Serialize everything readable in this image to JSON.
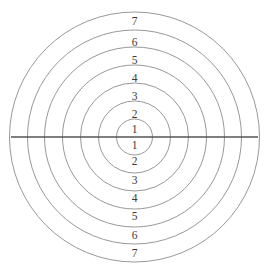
{
  "figure": {
    "name": "concentric-ring-target",
    "background_color": "#ffffff",
    "ring_stroke_color": "#8c8c8c",
    "axis_stroke_color": "#555555",
    "label_color": "#3a3a3a"
  },
  "chart_data": {
    "type": "scatter",
    "title": "",
    "subtitle": "",
    "xlabel": "",
    "ylabel": "",
    "grid": false,
    "legend": "none",
    "center": {
      "x": 134.5,
      "y": 137
    },
    "axis_ranges": {
      "x": [
        11,
        258
      ],
      "y": [
        12,
        262
      ]
    },
    "horizontal_line": {
      "x1": 11,
      "x2": 258,
      "y": 137
    },
    "ring_count": 7,
    "rings": [
      {
        "index": 1,
        "radius": 18,
        "label": "1"
      },
      {
        "index": 2,
        "radius": 36,
        "label": "2"
      },
      {
        "index": 3,
        "radius": 54,
        "label": "3"
      },
      {
        "index": 4,
        "radius": 72,
        "label": "4"
      },
      {
        "index": 5,
        "radius": 90,
        "label": "5"
      },
      {
        "index": 6,
        "radius": 107,
        "label": "6"
      },
      {
        "index": 7,
        "radius": 125,
        "label": "7"
      }
    ],
    "labels_above": [
      {
        "text": "7",
        "x": 134.5,
        "y": 22
      },
      {
        "text": "6",
        "x": 134.5,
        "y": 43
      },
      {
        "text": "5",
        "x": 134.5,
        "y": 61
      },
      {
        "text": "4",
        "x": 134.5,
        "y": 79
      },
      {
        "text": "3",
        "x": 134.5,
        "y": 97
      },
      {
        "text": "2",
        "x": 134.5,
        "y": 115
      },
      {
        "text": "1",
        "x": 134.5,
        "y": 130
      }
    ],
    "labels_below": [
      {
        "text": "1",
        "x": 134.5,
        "y": 146
      },
      {
        "text": "2",
        "x": 134.5,
        "y": 162
      },
      {
        "text": "3",
        "x": 134.5,
        "y": 181
      },
      {
        "text": "4",
        "x": 134.5,
        "y": 199
      },
      {
        "text": "5",
        "x": 134.5,
        "y": 217
      },
      {
        "text": "6",
        "x": 134.5,
        "y": 236
      },
      {
        "text": "7",
        "x": 134.5,
        "y": 254
      }
    ]
  }
}
